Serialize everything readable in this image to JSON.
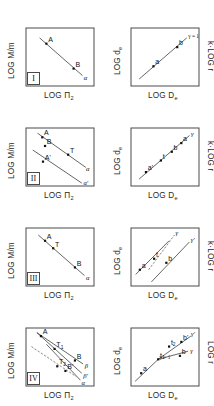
{
  "figure": {
    "axis_labels": {
      "left_y": "LOG M/m",
      "left_x": "LOG Π",
      "left_x_sub": "2",
      "right_y": "LOG d",
      "right_y_sub": "e",
      "right_x": "LOG D",
      "right_x_sub": "e",
      "right_secondary": "k·LOG r",
      "right_secondary_short": "LOG r"
    },
    "rows": [
      {
        "id": "row-1",
        "numeral": "I",
        "left": {
          "points": [
            {
              "label": "A",
              "sub": "",
              "x": 0.3,
              "y": 0.27
            },
            {
              "label": "B",
              "sub": "",
              "x": 0.7,
              "y": 0.7
            }
          ],
          "lines": [
            {
              "name": "alpha-line",
              "style": "solid",
              "label": "α",
              "x1": 0.2,
              "y1": 0.17,
              "x2": 0.83,
              "y2": 0.82
            }
          ]
        },
        "right": {
          "points": [
            {
              "label": "a",
              "sub": "",
              "x": 0.33,
              "y": 0.66
            },
            {
              "label": "b",
              "sub": "",
              "x": 0.68,
              "y": 0.33
            }
          ],
          "lines": [
            {
              "name": "gamma-line",
              "style": "solid",
              "label": "γ = 1",
              "x1": 0.12,
              "y1": 0.88,
              "x2": 0.82,
              "y2": 0.17
            }
          ]
        }
      },
      {
        "id": "row-2",
        "numeral": "II",
        "left": {
          "points": [
            {
              "label": "A",
              "sub": "",
              "x": 0.24,
              "y": 0.16
            },
            {
              "label": "B",
              "sub": "",
              "x": 0.28,
              "y": 0.31
            },
            {
              "label": "T",
              "sub": "",
              "x": 0.62,
              "y": 0.46
            },
            {
              "label": "A'",
              "sub": "",
              "x": 0.25,
              "y": 0.58
            }
          ],
          "lines": [
            {
              "name": "alpha-line",
              "style": "solid",
              "label": "α",
              "x1": 0.17,
              "y1": 0.09,
              "x2": 0.88,
              "y2": 0.68
            },
            {
              "name": "alpha-prime-line",
              "style": "solid",
              "label": "α'",
              "x1": 0.1,
              "y1": 0.38,
              "x2": 0.82,
              "y2": 0.95
            }
          ]
        },
        "right": {
          "points": [
            {
              "label": "a'",
              "sub": "",
              "x": 0.22,
              "y": 0.76
            },
            {
              "label": "t",
              "sub": "",
              "x": 0.44,
              "y": 0.56
            },
            {
              "label": "b",
              "sub": "",
              "x": 0.6,
              "y": 0.41
            },
            {
              "label": "a",
              "sub": "",
              "x": 0.74,
              "y": 0.26
            }
          ],
          "lines": [
            {
              "name": "gamma-line",
              "style": "solid",
              "label": "γ",
              "x1": 0.12,
              "y1": 0.88,
              "x2": 0.86,
              "y2": 0.13
            }
          ]
        }
      },
      {
        "id": "row-3",
        "numeral": "III",
        "left": {
          "points": [
            {
              "label": "A",
              "sub": "",
              "x": 0.28,
              "y": 0.22
            },
            {
              "label": "T",
              "sub": "",
              "x": 0.4,
              "y": 0.35
            },
            {
              "label": "B",
              "sub": "",
              "x": 0.72,
              "y": 0.68
            }
          ],
          "lines": [
            {
              "name": "alpha-line",
              "style": "solid",
              "label": "α",
              "x1": 0.18,
              "y1": 0.12,
              "x2": 0.86,
              "y2": 0.82
            }
          ]
        },
        "right": {
          "points": [
            {
              "label": "a",
              "sub": "",
              "x": 0.13,
              "y": 0.72
            },
            {
              "label": "t",
              "sub": "",
              "x": 0.34,
              "y": 0.53
            },
            {
              "label": "b",
              "sub": "",
              "x": 0.52,
              "y": 0.6
            }
          ],
          "lines": [
            {
              "name": "gamma-dashed-line",
              "style": "dashed",
              "label": "γ",
              "x1": 0.26,
              "y1": 0.72,
              "x2": 0.64,
              "y2": 0.12
            },
            {
              "name": "base-line",
              "style": "solid",
              "label": "",
              "x1": 0.07,
              "y1": 0.8,
              "x2": 0.56,
              "y2": 0.22
            },
            {
              "name": "gamma-prime-line",
              "style": "solid",
              "label": "γ'",
              "x1": 0.3,
              "y1": 0.93,
              "x2": 0.86,
              "y2": 0.24
            }
          ]
        }
      },
      {
        "id": "row-4",
        "numeral": "IV",
        "left": {
          "points": [
            {
              "label": "A",
              "sub": "",
              "x": 0.22,
              "y": 0.14
            },
            {
              "label": "T",
              "sub": "1",
              "x": 0.42,
              "y": 0.36
            },
            {
              "label": "T",
              "sub": "2",
              "x": 0.46,
              "y": 0.66
            },
            {
              "label": "B'",
              "sub": "",
              "x": 0.58,
              "y": 0.74
            },
            {
              "label": "B",
              "sub": "",
              "x": 0.72,
              "y": 0.56
            }
          ],
          "lines": [
            {
              "name": "beta-line",
              "style": "solid",
              "label": "β",
              "x1": 0.16,
              "y1": 0.08,
              "x2": 0.84,
              "y2": 0.62
            },
            {
              "name": "beta-prime-line",
              "style": "solid",
              "label": "β'",
              "x1": 0.16,
              "y1": 0.08,
              "x2": 0.82,
              "y2": 0.78
            },
            {
              "name": "alpha-line",
              "style": "solid",
              "label": "α",
              "x1": 0.3,
              "y1": 0.28,
              "x2": 0.8,
              "y2": 0.9
            },
            {
              "name": "dashed-guide",
              "style": "dashed",
              "label": "",
              "x1": 0.08,
              "y1": 0.32,
              "x2": 0.74,
              "y2": 0.84
            }
          ]
        },
        "right": {
          "points": [
            {
              "label": "a",
              "sub": "",
              "x": 0.15,
              "y": 0.78
            },
            {
              "label": "t",
              "sub": "1",
              "x": 0.4,
              "y": 0.54
            },
            {
              "label": "t",
              "sub": "2",
              "x": 0.56,
              "y": 0.32
            },
            {
              "label": "b'",
              "sub": "",
              "x": 0.74,
              "y": 0.24
            },
            {
              "label": "b",
              "sub": "",
              "x": 0.72,
              "y": 0.48
            }
          ],
          "lines": [
            {
              "name": "gamma-eq-1-line",
              "style": "solid",
              "label": "γ = 1",
              "x1": 0.06,
              "y1": 0.92,
              "x2": 0.4,
              "y2": 0.54
            },
            {
              "name": "gamma-prime-line",
              "style": "solid",
              "label": "γ'",
              "x1": 0.4,
              "y1": 0.54,
              "x2": 0.88,
              "y2": 0.14
            },
            {
              "name": "gamma-line",
              "style": "solid",
              "label": "γ",
              "x1": 0.4,
              "y1": 0.54,
              "x2": 0.84,
              "y2": 0.4
            }
          ]
        }
      }
    ],
    "colors": {
      "frame": "#4a4a4a",
      "line": "#555555",
      "dash": "#666666",
      "point": "#111111",
      "background": "#ffffff"
    }
  }
}
